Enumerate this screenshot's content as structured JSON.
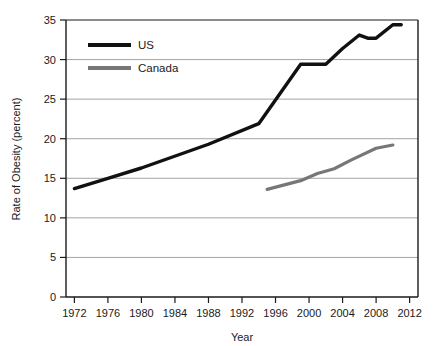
{
  "chart_data": {
    "type": "line",
    "title": "",
    "xlabel": "Year",
    "ylabel": "Rate of Obesity (percent)",
    "xlim": [
      1971,
      2013
    ],
    "ylim": [
      0,
      35
    ],
    "xticks": [
      1972,
      1976,
      1980,
      1984,
      1988,
      1992,
      1996,
      2000,
      2004,
      2008,
      2012
    ],
    "yticks": [
      0,
      5,
      10,
      15,
      20,
      25,
      30,
      35
    ],
    "grid": "horizontal",
    "legend_position": "top-left-inside",
    "series": [
      {
        "name": "US",
        "color": "#111111",
        "x": [
          1972,
          1976,
          1980,
          1988,
          1994,
          1999,
          2000,
          2002,
          2004,
          2006,
          2007,
          2008,
          2010,
          2011
        ],
        "values": [
          13.7,
          15.0,
          16.3,
          19.3,
          21.9,
          29.4,
          29.4,
          29.4,
          31.4,
          33.1,
          32.7,
          32.7,
          34.4,
          34.4
        ]
      },
      {
        "name": "Canada",
        "color": "#777777",
        "x": [
          1995,
          1999,
          2001,
          2003,
          2005,
          2008,
          2010
        ],
        "values": [
          13.6,
          14.7,
          15.6,
          16.2,
          17.3,
          18.8,
          19.2
        ]
      }
    ]
  },
  "legend": {
    "items": [
      {
        "label": "US",
        "color": "#111111"
      },
      {
        "label": "Canada",
        "color": "#777777"
      }
    ]
  },
  "axes": {
    "x_title": "Year",
    "y_title": "Rate of Obesity (percent)",
    "x_tick_labels": [
      "1972",
      "1976",
      "1980",
      "1984",
      "1988",
      "1992",
      "1996",
      "2000",
      "2004",
      "2008",
      "2012"
    ],
    "y_tick_labels": [
      "0",
      "5",
      "10",
      "15",
      "20",
      "25",
      "30",
      "35"
    ]
  },
  "colors": {
    "background": "#ffffff",
    "axis": "#1a1a1a",
    "gridline": "#9a9a9a",
    "us": "#111111",
    "canada": "#777777"
  }
}
